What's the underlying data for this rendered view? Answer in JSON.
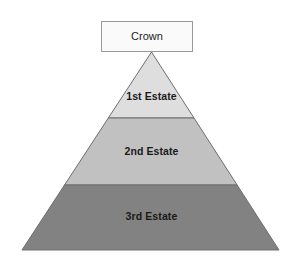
{
  "diagram": {
    "type": "pyramid-hierarchy",
    "background_color": "#ffffff",
    "crown": {
      "label": "Crown",
      "fill_color": "#fafafa",
      "border_color": "#9a9a9a",
      "text_color": "#1a1a1a",
      "box": {
        "x": 101,
        "y": 21,
        "width": 92,
        "height": 31
      }
    },
    "pyramid": {
      "apex": {
        "x": 151.5,
        "y": 52
      },
      "base_left": {
        "x": 22,
        "y": 250
      },
      "base_right": {
        "x": 279,
        "y": 250
      },
      "outline_color": "#6e6e6e",
      "bands": [
        {
          "label": "1st Estate",
          "rank": 1,
          "fill_color": "#dedede",
          "text_color": "#1a1a1a",
          "top_y": 52,
          "bottom_y": 118,
          "label_y": 97
        },
        {
          "label": "2nd Estate",
          "rank": 2,
          "fill_color": "#c1c1c1",
          "text_color": "#1a1a1a",
          "top_y": 118,
          "bottom_y": 185,
          "label_y": 152
        },
        {
          "label": "3rd Estate",
          "rank": 3,
          "fill_color": "#828282",
          "text_color": "#161616",
          "top_y": 185,
          "bottom_y": 250,
          "label_y": 217
        }
      ]
    }
  }
}
